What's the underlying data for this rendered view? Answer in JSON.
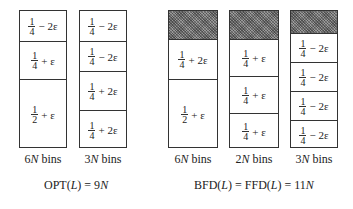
{
  "left_group": {
    "bins": [
      {
        "label_num": "6",
        "label_var": "N",
        "label_rest": " bins",
        "segments": [
          {
            "num": "1",
            "den": "4",
            "term": "− 2ε",
            "height": 30
          },
          {
            "num": "1",
            "den": "4",
            "term": "+ ε",
            "height": 38
          },
          {
            "num": "1",
            "den": "2",
            "term": "+ ε",
            "height": 70
          }
        ]
      },
      {
        "label_num": "3",
        "label_var": "N",
        "label_rest": " bins",
        "segments": [
          {
            "num": "1",
            "den": "4",
            "term": "− 2ε",
            "height": 30
          },
          {
            "num": "1",
            "den": "4",
            "term": "− 2ε",
            "height": 30
          },
          {
            "num": "1",
            "den": "4",
            "term": "+ 2ε",
            "height": 39
          },
          {
            "num": "1",
            "den": "4",
            "term": "+ 2ε",
            "height": 39
          }
        ]
      }
    ],
    "equation": {
      "pre": "OPT(",
      "var": "L",
      "post": ") = 9",
      "var2": "N"
    }
  },
  "right_group": {
    "bins": [
      {
        "label_num": "6",
        "label_var": "N",
        "label_rest": " bins",
        "hatch_height": 28,
        "segments": [
          {
            "num": "1",
            "den": "4",
            "term": "+ 2ε",
            "height": 40
          },
          {
            "num": "1",
            "den": "2",
            "term": "+ ε",
            "height": 70
          }
        ]
      },
      {
        "label_num": "2",
        "label_var": "N",
        "label_rest": " bins",
        "hatch_height": 28,
        "segments": [
          {
            "num": "1",
            "den": "4",
            "term": "+ ε",
            "height": 37
          },
          {
            "num": "1",
            "den": "4",
            "term": "+ ε",
            "height": 37
          },
          {
            "num": "1",
            "den": "4",
            "term": "+ ε",
            "height": 36
          }
        ]
      },
      {
        "label_num": "3",
        "label_var": "N",
        "label_rest": " bins",
        "hatch_height": 22,
        "segments": [
          {
            "num": "1",
            "den": "4",
            "term": "− 2ε",
            "height": 29
          },
          {
            "num": "1",
            "den": "4",
            "term": "− 2ε",
            "height": 29
          },
          {
            "num": "1",
            "den": "4",
            "term": "− 2ε",
            "height": 29
          },
          {
            "num": "1",
            "den": "4",
            "term": "− 2ε",
            "height": 29
          }
        ]
      }
    ],
    "equation": {
      "pre1": "BFD(",
      "var": "L",
      "mid": ") = FFD(",
      "var_b": "L",
      "post": ") = 11",
      "var2": "N"
    }
  },
  "colors": {
    "border": "#333333",
    "hatch": "#777777",
    "background": "#ffffff"
  }
}
